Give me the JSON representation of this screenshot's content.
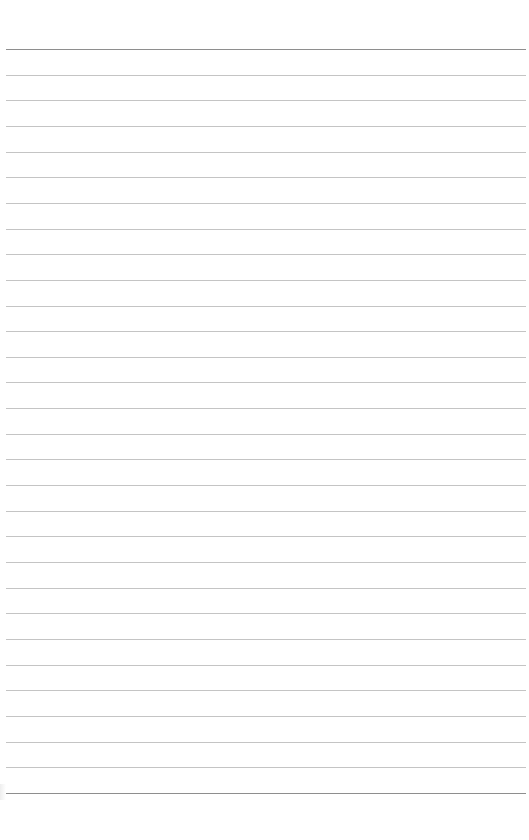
{
  "page": {
    "type": "lined-paper",
    "background_color": "#ffffff",
    "line_color": "#c4c4c4",
    "edge_line_color": "#8e8e8e",
    "line_count": 30,
    "first_line_y": 49,
    "line_spacing": 25.65,
    "line_left": 6,
    "line_width": 520,
    "text": ""
  }
}
